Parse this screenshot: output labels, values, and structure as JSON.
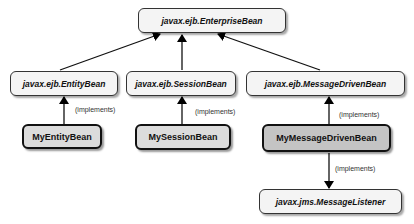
{
  "diagram": {
    "nodes": {
      "enterprise_bean": "javax.ejb.EnterpriseBean",
      "entity_bean": "javax.ejb.EntityBean",
      "session_bean": "javax.ejb.SessionBean",
      "message_driven_bean": "javax.ejb.MessageDrivenBean",
      "my_entity_bean": "MyEntityBean",
      "my_session_bean": "MySessionBean",
      "my_message_driven_bean": "MyMessageDrivenBean",
      "message_listener": "javax.jms.MessageListener"
    },
    "edge_labels": {
      "entity_impl": "(implements)",
      "session_impl": "(implements)",
      "mdb_impl": "(implements)",
      "listener_impl": "(implements)"
    }
  }
}
